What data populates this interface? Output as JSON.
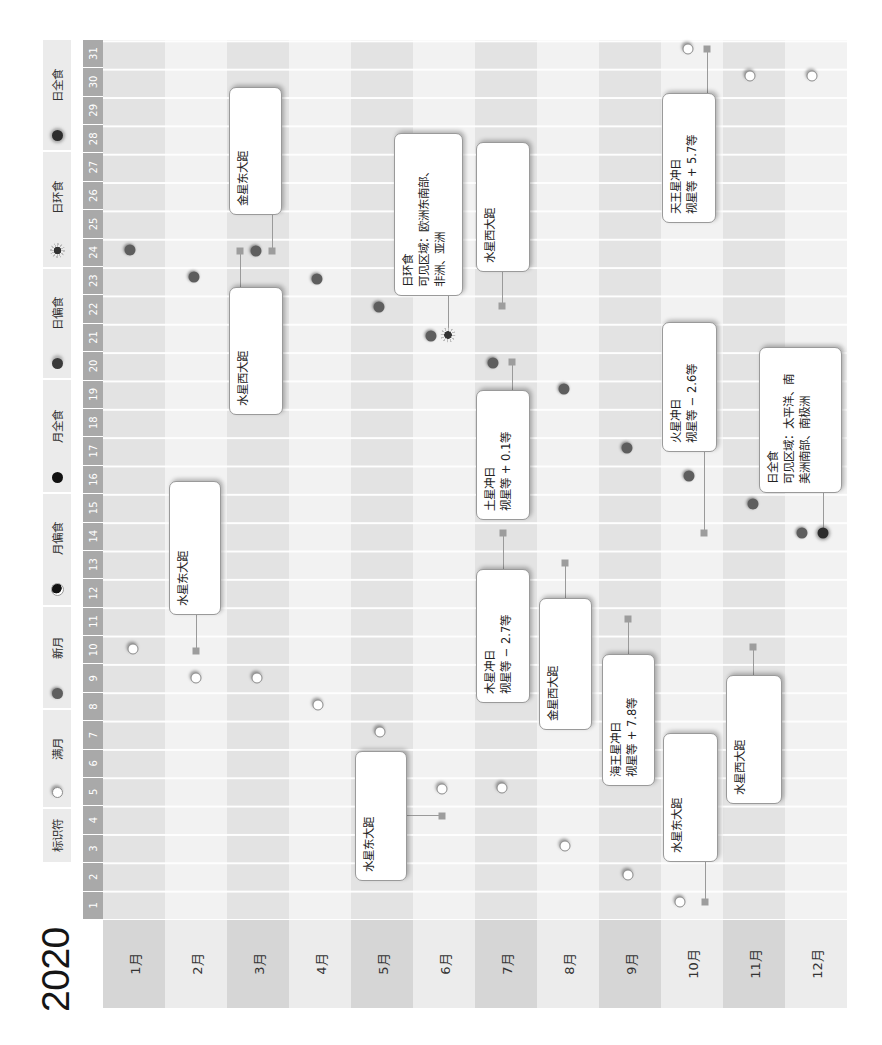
{
  "title": "2020",
  "legend": {
    "header": "标识符",
    "items": [
      {
        "icon": "full-moon-icon",
        "label": "满月"
      },
      {
        "icon": "new-moon-icon",
        "label": "新月"
      },
      {
        "icon": "partial-lunar-eclipse-icon",
        "label": "月偏食"
      },
      {
        "icon": "total-lunar-eclipse-icon",
        "label": "月全食"
      },
      {
        "icon": "partial-solar-eclipse-icon",
        "label": "日偏食"
      },
      {
        "icon": "annular-solar-eclipse-icon",
        "label": "日环食"
      },
      {
        "icon": "total-solar-eclipse-icon",
        "label": "日全食"
      }
    ]
  },
  "colors": {
    "odd_month_label": "#d6d6d6",
    "odd_month_grid": "#e3e3e3",
    "even_month_label": "#ececec",
    "even_month_grid": "#f2f2f2",
    "day_header": "#a9a9a9",
    "marker": "#9d9d9d",
    "new_moon": "#5e5e5e"
  },
  "chart_data": {
    "type": "table",
    "title": "2020",
    "orientation": "rotated 90° counter-clockwise",
    "row_labels": [
      "1月",
      "2月",
      "3月",
      "4月",
      "5月",
      "6月",
      "7月",
      "8月",
      "9月",
      "10月",
      "11月",
      "12月"
    ],
    "column_labels": [
      "1",
      "2",
      "3",
      "4",
      "5",
      "6",
      "7",
      "8",
      "9",
      "10",
      "11",
      "12",
      "13",
      "14",
      "15",
      "16",
      "17",
      "18",
      "19",
      "20",
      "21",
      "22",
      "23",
      "24",
      "25",
      "26",
      "27",
      "28",
      "29",
      "30",
      "31"
    ],
    "moon_phases": [
      {
        "type": "满月",
        "month": 1,
        "day": 10
      },
      {
        "type": "满月",
        "month": 2,
        "day": 9
      },
      {
        "type": "满月",
        "month": 3,
        "day": 9
      },
      {
        "type": "满月",
        "month": 4,
        "day": 8
      },
      {
        "type": "满月",
        "month": 5,
        "day": 7
      },
      {
        "type": "满月",
        "month": 6,
        "day": 5
      },
      {
        "type": "满月",
        "month": 7,
        "day": 5
      },
      {
        "type": "满月",
        "month": 8,
        "day": 3
      },
      {
        "type": "满月",
        "month": 9,
        "day": 2
      },
      {
        "type": "满月",
        "month": 10,
        "day": 1
      },
      {
        "type": "满月",
        "month": 10,
        "day": 31
      },
      {
        "type": "满月",
        "month": 11,
        "day": 30
      },
      {
        "type": "满月",
        "month": 12,
        "day": 30
      },
      {
        "type": "新月",
        "month": 1,
        "day": 24
      },
      {
        "type": "新月",
        "month": 2,
        "day": 23
      },
      {
        "type": "新月",
        "month": 3,
        "day": 24
      },
      {
        "type": "新月",
        "month": 4,
        "day": 23
      },
      {
        "type": "新月",
        "month": 5,
        "day": 22
      },
      {
        "type": "新月",
        "month": 6,
        "day": 21
      },
      {
        "type": "新月",
        "month": 7,
        "day": 20
      },
      {
        "type": "新月",
        "month": 8,
        "day": 19
      },
      {
        "type": "新月",
        "month": 9,
        "day": 17
      },
      {
        "type": "新月",
        "month": 10,
        "day": 16
      },
      {
        "type": "新月",
        "month": 11,
        "day": 15
      },
      {
        "type": "新月",
        "month": 12,
        "day": 14
      }
    ],
    "eclipses": [
      {
        "type": "日环食",
        "month": 6,
        "day": 21
      },
      {
        "type": "日全食",
        "month": 12,
        "day": 14
      }
    ],
    "annotations": [
      {
        "month": 2,
        "day": 10,
        "lines": [
          "水星东大距"
        ]
      },
      {
        "month": 3,
        "day": 24,
        "lines": [
          "金星东大距"
        ]
      },
      {
        "month": 3,
        "day": 24,
        "lines": [
          "水星西大距"
        ]
      },
      {
        "month": 6,
        "day": 4,
        "lines": [
          "水星东大距"
        ]
      },
      {
        "month": 6,
        "day": 21,
        "lines": [
          "日环食",
          "可见区域：欧洲东南部、",
          "非洲、亚洲"
        ]
      },
      {
        "month": 7,
        "day": 22,
        "lines": [
          "水星西大距"
        ]
      },
      {
        "month": 7,
        "day": 20,
        "lines": [
          "土星冲日",
          "视星等 + 0.1等"
        ]
      },
      {
        "month": 7,
        "day": 14,
        "lines": [
          "木星冲日",
          "视星等 − 2.7等"
        ]
      },
      {
        "month": 8,
        "day": 13,
        "lines": [
          "金星西大距"
        ]
      },
      {
        "month": 9,
        "day": 11,
        "lines": [
          "海王星冲日",
          "视星等 + 7.8等"
        ]
      },
      {
        "month": 10,
        "day": 1,
        "lines": [
          "水星东大距"
        ]
      },
      {
        "month": 10,
        "day": 14,
        "lines": [
          "火星冲日",
          "视星等 − 2.6等"
        ]
      },
      {
        "month": 10,
        "day": 31,
        "lines": [
          "天王星冲日",
          "视星等 + 5.7等"
        ]
      },
      {
        "month": 11,
        "day": 10,
        "lines": [
          "水星西大距"
        ]
      },
      {
        "month": 12,
        "day": 14,
        "lines": [
          "日全食",
          "可见区域：太平洋、南",
          "美洲南部、南极洲"
        ]
      }
    ]
  }
}
